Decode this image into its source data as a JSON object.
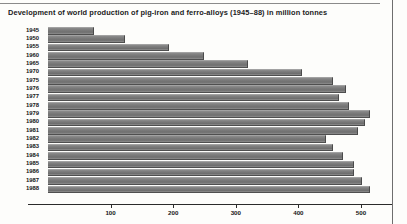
{
  "title": "Development of world production of pig-iron and ferro-alloys (1945–88) in million tonnes",
  "colors": {
    "bar_fill": "#7b7b7b",
    "bar_highlight": "#8f8f8f",
    "bar_shadow": "#4f4f4f",
    "axis": "#2b2b2b",
    "text": "#161616",
    "page_background": "#fdfdfb"
  },
  "axis": {
    "tick_labels": [
      "100",
      "200",
      "300",
      "400",
      "500"
    ],
    "tick_values": [
      100,
      200,
      300,
      400,
      500
    ],
    "xmin": 0,
    "xmax": 540
  },
  "chart_data": {
    "type": "bar",
    "orientation": "horizontal",
    "title": "Development of world production of pig-iron and ferro-alloys (1945–88) in million tonnes",
    "xlabel": "",
    "ylabel": "",
    "xlim": [
      0,
      540
    ],
    "grid": false,
    "legend": "none",
    "unit": "million tonnes",
    "categories": [
      "1945",
      "1950",
      "1955",
      "1960",
      "1965",
      "1970",
      "1975",
      "1976",
      "1977",
      "1978",
      "1979",
      "1980",
      "1981",
      "1982",
      "1983",
      "1984",
      "1985",
      "1986",
      "1987",
      "1988"
    ],
    "values": [
      72,
      122,
      192,
      248,
      318,
      404,
      453,
      474,
      464,
      479,
      512,
      504,
      494,
      443,
      453,
      469,
      487,
      487,
      500,
      512
    ]
  }
}
